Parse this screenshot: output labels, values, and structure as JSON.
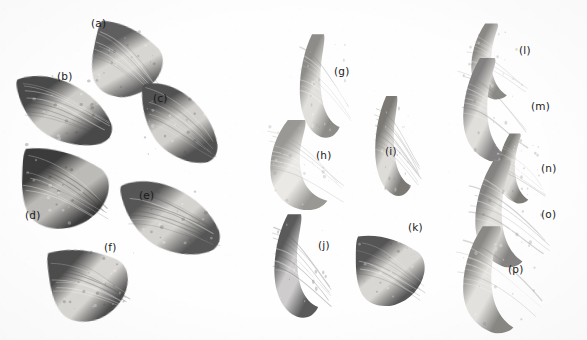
{
  "figure": {
    "kind": "photographic-plate",
    "background_color": "#fefefe",
    "ink_color": "#1a1a1a",
    "width": 587,
    "height": 340,
    "groups": [
      {
        "name": "left-group",
        "members": [
          "a",
          "b",
          "c",
          "d",
          "e",
          "f"
        ]
      },
      {
        "name": "middle-group",
        "members": [
          "g",
          "h",
          "i",
          "j",
          "k"
        ]
      },
      {
        "name": "right-group",
        "members": [
          "l",
          "m",
          "n",
          "o",
          "p"
        ]
      }
    ]
  },
  "specimens": [
    {
      "id": "a",
      "label": "(a)",
      "label_x": 91,
      "label_y": 18,
      "x": 88,
      "y": 22,
      "w": 78,
      "h": 78,
      "rotation": 12,
      "form": "broad-triangular-crown",
      "tone_dark": "#5e5e5e",
      "tone_light": "#d8d6d2",
      "shape": "crown"
    },
    {
      "id": "b",
      "label": "(b)",
      "label_x": 57,
      "label_y": 71,
      "x": 16,
      "y": 68,
      "w": 98,
      "h": 82,
      "rotation": -4,
      "form": "recurved-blade",
      "tone_dark": "#4a4a4a",
      "tone_light": "#cfcdc9",
      "shape": "blade"
    },
    {
      "id": "c",
      "label": "(c)",
      "label_x": 153,
      "label_y": 93,
      "x": 137,
      "y": 80,
      "w": 86,
      "h": 84,
      "rotation": 6,
      "form": "recurved-blade",
      "tone_dark": "#515151",
      "tone_light": "#d2d0cc",
      "shape": "blade"
    },
    {
      "id": "d",
      "label": "(d)",
      "label_x": 25,
      "label_y": 210,
      "x": 17,
      "y": 145,
      "w": 96,
      "h": 86,
      "rotation": 2,
      "form": "broad-triangular-crown",
      "tone_dark": "#3b3b3b",
      "tone_light": "#bdbbb7",
      "shape": "crown"
    },
    {
      "id": "e",
      "label": "(e)",
      "label_x": 139,
      "label_y": 190,
      "x": 121,
      "y": 172,
      "w": 100,
      "h": 88,
      "rotation": -6,
      "form": "recurved-blade",
      "tone_dark": "#565656",
      "tone_light": "#d5d3cf",
      "shape": "blade"
    },
    {
      "id": "f",
      "label": "(f)",
      "label_x": 104,
      "label_y": 242,
      "x": 46,
      "y": 243,
      "w": 86,
      "h": 80,
      "rotation": -8,
      "form": "broad-triangular-crown",
      "tone_dark": "#4e4e4e",
      "tone_light": "#d9d7d3",
      "shape": "crown"
    },
    {
      "id": "g",
      "label": "(g)",
      "label_x": 334,
      "label_y": 66,
      "x": 294,
      "y": 32,
      "w": 60,
      "h": 108,
      "rotation": 0,
      "form": "slender-curved-horn",
      "tone_dark": "#8e8c88",
      "tone_light": "#e2e0dc",
      "shape": "horn"
    },
    {
      "id": "h",
      "label": "(h)",
      "label_x": 316,
      "label_y": 150,
      "x": 262,
      "y": 118,
      "w": 86,
      "h": 94,
      "rotation": 0,
      "form": "elongate-fragment",
      "tone_dark": "#9a9894",
      "tone_light": "#ebe9e5",
      "shape": "horn"
    },
    {
      "id": "i",
      "label": "(i)",
      "label_x": 385,
      "label_y": 146,
      "x": 370,
      "y": 94,
      "w": 54,
      "h": 104,
      "rotation": 0,
      "form": "slender-curved-horn",
      "tone_dark": "#7b7975",
      "tone_light": "#dedcd8",
      "shape": "horn"
    },
    {
      "id": "j",
      "label": "(j)",
      "label_x": 318,
      "label_y": 240,
      "x": 268,
      "y": 212,
      "w": 66,
      "h": 108,
      "rotation": 0,
      "form": "strongly-curved-horn",
      "tone_dark": "#5a5a5a",
      "tone_light": "#cecccd",
      "shape": "horn"
    },
    {
      "id": "k",
      "label": "(k)",
      "label_x": 408,
      "label_y": 222,
      "x": 352,
      "y": 232,
      "w": 76,
      "h": 76,
      "rotation": 0,
      "form": "broad-crown-fragment",
      "tone_dark": "#555555",
      "tone_light": "#d9d7d3",
      "shape": "crown"
    },
    {
      "id": "l",
      "label": "(l)",
      "label_x": 519,
      "label_y": 45,
      "x": 462,
      "y": 22,
      "w": 68,
      "h": 78,
      "rotation": 0,
      "form": "slender-tapering-spine",
      "tone_dark": "#8b8985",
      "tone_light": "#e6e4e0",
      "shape": "spine"
    },
    {
      "id": "m",
      "label": "(m)",
      "label_x": 531,
      "label_y": 101,
      "x": 452,
      "y": 56,
      "w": 82,
      "h": 106,
      "rotation": 0,
      "form": "slender-tapering-spine",
      "tone_dark": "#828080",
      "tone_light": "#e1dfdb",
      "shape": "spine"
    },
    {
      "id": "n",
      "label": "(n)",
      "label_x": 541,
      "label_y": 163,
      "x": 490,
      "y": 132,
      "w": 58,
      "h": 72,
      "rotation": 0,
      "form": "slender-tapering-spine",
      "tone_dark": "#7d7b77",
      "tone_light": "#dfddd9",
      "shape": "spine"
    },
    {
      "id": "o",
      "label": "(o)",
      "label_x": 541,
      "label_y": 209,
      "x": 463,
      "y": 158,
      "w": 90,
      "h": 110,
      "rotation": 0,
      "form": "slender-tapering-spine",
      "tone_dark": "#858381",
      "tone_light": "#e3e1dd",
      "shape": "spine"
    },
    {
      "id": "p",
      "label": "(p)",
      "label_x": 508,
      "label_y": 264,
      "x": 450,
      "y": 224,
      "w": 96,
      "h": 110,
      "rotation": 0,
      "form": "slender-tapering-spine",
      "tone_dark": "#8a8884",
      "tone_light": "#e5e3df",
      "shape": "spine"
    }
  ]
}
